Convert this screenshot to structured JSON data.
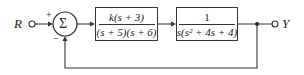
{
  "diagram": {
    "type": "feedback-control-block-diagram",
    "input_label": "R",
    "output_label": "Y",
    "summing_junction": {
      "symbol": "Σ",
      "plus_sign": "+",
      "minus_sign": "−"
    },
    "blocks": [
      {
        "numerator": "k(s + 3)",
        "denominator": "(s + 5)(s + 6)"
      },
      {
        "numerator": "1",
        "denominator": "s(s² + 4s + 4)"
      }
    ],
    "feedback": "unity negative"
  },
  "colors": {
    "line": "#333333",
    "background": "#ffffff"
  }
}
